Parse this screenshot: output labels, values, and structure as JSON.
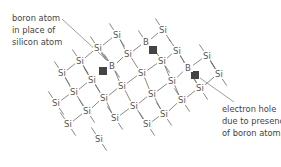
{
  "diagram": {
    "title": "",
    "colors": {
      "text": "#444444",
      "bond": "#6a6a6a",
      "hole": "#444444"
    },
    "labels": {
      "boron": {
        "lines": [
          "boron atom",
          "in place of",
          "silicon atom"
        ]
      },
      "hole": {
        "lines": [
          "electron hole",
          "due to presence",
          "of boron atom"
        ]
      }
    },
    "atoms": [
      {
        "s": "Si",
        "x": 117,
        "y": 35
      },
      {
        "s": "Si",
        "x": 163,
        "y": 30
      },
      {
        "s": "Si",
        "x": 98,
        "y": 48
      },
      {
        "s": "B",
        "x": 146,
        "y": 42
      },
      {
        "s": "Si",
        "x": 128,
        "y": 54
      },
      {
        "s": "Si",
        "x": 177,
        "y": 51
      },
      {
        "s": "Si",
        "x": 80,
        "y": 61
      },
      {
        "s": "B",
        "x": 112,
        "y": 66
      },
      {
        "s": "Si",
        "x": 162,
        "y": 61
      },
      {
        "s": "Si",
        "x": 207,
        "y": 56
      },
      {
        "s": "Si",
        "x": 62,
        "y": 73
      },
      {
        "s": "Si",
        "x": 92,
        "y": 80
      },
      {
        "s": "Si",
        "x": 142,
        "y": 73
      },
      {
        "s": "B",
        "x": 188,
        "y": 68
      },
      {
        "s": "Si",
        "x": 172,
        "y": 81
      },
      {
        "s": "Si",
        "x": 219,
        "y": 74
      },
      {
        "s": "Si",
        "x": 74,
        "y": 92
      },
      {
        "s": "Si",
        "x": 122,
        "y": 86
      },
      {
        "s": "Si",
        "x": 104,
        "y": 98
      },
      {
        "s": "Si",
        "x": 152,
        "y": 94
      },
      {
        "s": "Si",
        "x": 200,
        "y": 88
      },
      {
        "s": "Si",
        "x": 56,
        "y": 103
      },
      {
        "s": "Si",
        "x": 134,
        "y": 106
      },
      {
        "s": "Si",
        "x": 182,
        "y": 100
      },
      {
        "s": "Si",
        "x": 87,
        "y": 111
      },
      {
        "s": "Si",
        "x": 164,
        "y": 114
      },
      {
        "s": "Si",
        "x": 115,
        "y": 118
      },
      {
        "s": "Si",
        "x": 147,
        "y": 124
      },
      {
        "s": "Si",
        "x": 68,
        "y": 124
      },
      {
        "s": "Si",
        "x": 99,
        "y": 139
      }
    ],
    "holes": [
      {
        "x": 103,
        "y": 71
      },
      {
        "x": 153,
        "y": 50
      },
      {
        "x": 195,
        "y": 75
      }
    ]
  }
}
